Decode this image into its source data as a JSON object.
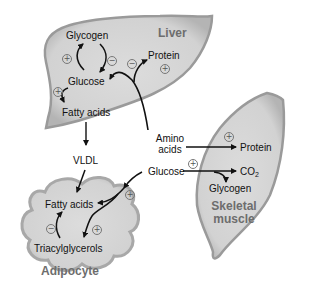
{
  "organs": {
    "liver": {
      "name": "Liver",
      "nodes": [
        "Glycogen",
        "Glucose",
        "Fatty acids",
        "Protein"
      ]
    },
    "adipocyte": {
      "name": "Adipocyte",
      "nodes": [
        "Fatty acids",
        "Triacylglycerols"
      ]
    },
    "skeletal_muscle": {
      "name_line1": "Skeletal",
      "name_line2": "muscle",
      "nodes": [
        "Protein",
        "CO2",
        "Glycogen"
      ]
    }
  },
  "blood": {
    "amino_acids_line1": "Amino",
    "amino_acids_line2": "acids",
    "glucose": "Glucose",
    "vldl": "VLDL"
  },
  "co2": {
    "base": "CO",
    "sub": "2"
  },
  "signs": {
    "plus": "+",
    "minus": "−"
  },
  "colors": {
    "organ_fill": "#d6d6d6",
    "organ_edge": "#9a9a9a",
    "arrow": "#111111",
    "organ_label": "#6d6d6d"
  }
}
